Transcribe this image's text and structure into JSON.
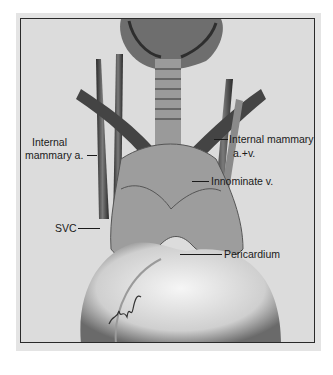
{
  "figure": {
    "type": "anatomical illustration",
    "labels": {
      "internal_mammary_a_line1": "Internal",
      "internal_mammary_a_line2": "mammary a.",
      "internal_mammary_av_line1": "Internal mammary",
      "internal_mammary_av_line2": "a.+v.",
      "innominate_v": "Innominate v.",
      "svc": "SVC",
      "pericardium": "Pericardium"
    },
    "colors": {
      "background": "#dcdcdc",
      "border": "#2a2a2a",
      "tissue_dark": "#3a3a3a",
      "tissue_mid": "#8a8a8a",
      "heart_light": "#f2f2f2"
    }
  }
}
